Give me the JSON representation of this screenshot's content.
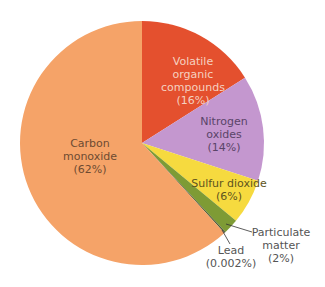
{
  "chart_data": {
    "type": "pie",
    "title": "",
    "start_angle_deg": -90,
    "direction": "clockwise",
    "center": [
      142,
      143
    ],
    "radius": 122,
    "slices": [
      {
        "name": "Volatile organic compounds",
        "value": 16,
        "label_lines": [
          "Volatile",
          "organic",
          "compounds",
          "(16%)"
        ],
        "color": "#E4502E",
        "text_color": "#F5D0C0"
      },
      {
        "name": "Nitrogen oxides",
        "value": 14,
        "label_lines": [
          "Nitrogen",
          "oxides",
          "(14%)"
        ],
        "color": "#C497CF",
        "text_color": "#5A4468"
      },
      {
        "name": "Sulfur dioxide",
        "value": 6,
        "label_lines": [
          "Sulfur dioxide",
          "(6%)"
        ],
        "color": "#F6DA3F",
        "text_color": "#5E5420"
      },
      {
        "name": "Particulate matter",
        "value": 2,
        "label_lines": [
          "Particulate",
          "matter",
          "(2%)"
        ],
        "color": "#7E9B35",
        "text_color": "#555555"
      },
      {
        "name": "Lead",
        "value": 0.002,
        "display_sweep_deg": 0.7,
        "label_lines": [
          "Lead",
          "(0.002%)"
        ],
        "color": "#4E5E3A",
        "text_color": "#555555"
      },
      {
        "name": "Carbon monoxide",
        "value": 62,
        "label_lines": [
          "Carbon",
          "monoxide",
          "(62%)"
        ],
        "color": "#F5A368",
        "text_color": "#6E4B32"
      }
    ],
    "legend": null,
    "grid": false
  },
  "labels": {
    "voc": {
      "line1": "Volatile",
      "line2": "organic",
      "line3": "compounds",
      "line4": "(16%)"
    },
    "nox": {
      "line1": "Nitrogen",
      "line2": "oxides",
      "line3": "(14%)"
    },
    "so2": {
      "line1": "Sulfur dioxide",
      "line2": "(6%)"
    },
    "pm": {
      "line1": "Particulate",
      "line2": "matter",
      "line3": "(2%)"
    },
    "lead": {
      "line1": "Lead",
      "line2": "(0.002%)"
    },
    "co": {
      "line1": "Carbon",
      "line2": "monoxide",
      "line3": "(62%)"
    }
  }
}
